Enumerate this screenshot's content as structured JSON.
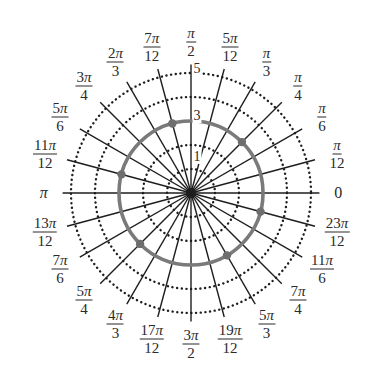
{
  "diagram": {
    "type": "polar-grid",
    "center": {
      "x": 191,
      "y": 193
    },
    "unit_px": 24,
    "ray_length_units": 5.35,
    "dotted_circle_radii": [
      1,
      2,
      4,
      5
    ],
    "solid_circle_radius": 3,
    "colors": {
      "rays": "#1e1e1e",
      "dotted_circles": "#1e1e1e",
      "solid_circle": "#7a7a7a",
      "points": "#6e6e6e",
      "text": "#2a2a2a"
    },
    "radius_labels": [
      {
        "value": "1",
        "r": 1.5
      },
      {
        "value": "3",
        "r": 3.2
      },
      {
        "value": "5",
        "r": 5.15
      }
    ],
    "angle_labels": [
      {
        "k": 0,
        "num": "0",
        "den": ""
      },
      {
        "k": 1,
        "num": "π",
        "den": "12"
      },
      {
        "k": 2,
        "num": "π",
        "den": "6"
      },
      {
        "k": 3,
        "num": "π",
        "den": "4"
      },
      {
        "k": 4,
        "num": "π",
        "den": "3"
      },
      {
        "k": 5,
        "num": "5π",
        "den": "12"
      },
      {
        "k": 6,
        "num": "π",
        "den": "2"
      },
      {
        "k": 7,
        "num": "7π",
        "den": "12"
      },
      {
        "k": 8,
        "num": "2π",
        "den": "3"
      },
      {
        "k": 9,
        "num": "3π",
        "den": "4"
      },
      {
        "k": 10,
        "num": "5π",
        "den": "6"
      },
      {
        "k": 11,
        "num": "11π",
        "den": "12"
      },
      {
        "k": 12,
        "num": "π",
        "den": ""
      },
      {
        "k": 13,
        "num": "13π",
        "den": "12"
      },
      {
        "k": 14,
        "num": "7π",
        "den": "6"
      },
      {
        "k": 15,
        "num": "5π",
        "den": "4"
      },
      {
        "k": 16,
        "num": "4π",
        "den": "3"
      },
      {
        "k": 17,
        "num": "17π",
        "den": "12"
      },
      {
        "k": 18,
        "num": "3π",
        "den": "2"
      },
      {
        "k": 19,
        "num": "19π",
        "den": "12"
      },
      {
        "k": 20,
        "num": "5π",
        "den": "3"
      },
      {
        "k": 21,
        "num": "7π",
        "den": "4"
      },
      {
        "k": 22,
        "num": "11π",
        "den": "6"
      },
      {
        "k": 23,
        "num": "23π",
        "den": "12"
      }
    ],
    "label_radius_units": 6.3,
    "points": [
      {
        "r": 3,
        "theta": "π/4",
        "k": 3
      },
      {
        "r": 3,
        "theta": "7π/12",
        "k": 7
      },
      {
        "r": 3,
        "theta": "11π/12",
        "k": 11
      },
      {
        "r": 3,
        "theta": "5π/4",
        "k": 15
      },
      {
        "r": 3,
        "theta": "5π/3",
        "k": 20
      },
      {
        "r": 3,
        "theta": "23π/12",
        "k": 23
      }
    ]
  }
}
